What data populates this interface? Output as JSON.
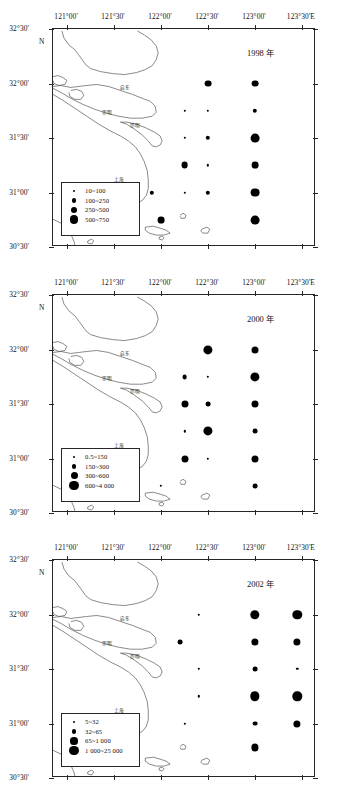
{
  "figure": {
    "caption": "",
    "axis": {
      "x_ticks": [
        "121°00'",
        "121°30'",
        "122°00'",
        "122°30'",
        "123°00'",
        "123°30'E"
      ],
      "x_values": [
        121.0,
        121.5,
        122.0,
        122.5,
        123.0,
        123.5
      ],
      "y_ticks": [
        "32°30'",
        "32°00'",
        "31°30'",
        "31°00'",
        "30°30'"
      ],
      "y_values": [
        32.5,
        32.0,
        31.5,
        31.0,
        30.5
      ],
      "north_label": "N",
      "xlim": [
        120.85,
        123.65
      ],
      "ylim": [
        30.5,
        32.5
      ]
    },
    "places": [
      {
        "name": "启东",
        "x": 121.62,
        "y": 31.97
      },
      {
        "name": "崇明",
        "x": 121.43,
        "y": 31.74
      },
      {
        "name": "崇明",
        "x": 121.72,
        "y": 31.62
      },
      {
        "name": "上海",
        "x": 121.55,
        "y": 31.12
      }
    ]
  },
  "chart_data": [
    {
      "type": "scatter",
      "title": "1998 年",
      "xlabel": "",
      "ylabel": "",
      "xlim": [
        120.85,
        123.65
      ],
      "ylim": [
        30.5,
        32.5
      ],
      "grid": false,
      "legend_position": "bottom-left",
      "legend_title": "",
      "size_classes": [
        {
          "label": "10~100",
          "radius_px": 1.2,
          "range": [
            10,
            100
          ]
        },
        {
          "label": "100~250",
          "radius_px": 2.2,
          "range": [
            100,
            250
          ]
        },
        {
          "label": "250~500",
          "radius_px": 3.4,
          "range": [
            250,
            500
          ]
        },
        {
          "label": "500~750",
          "radius_px": 4.4,
          "range": [
            500,
            750
          ]
        }
      ],
      "points": [
        {
          "x": 122.5,
          "y": 32.0,
          "class": 2
        },
        {
          "x": 123.0,
          "y": 32.0,
          "class": 2
        },
        {
          "x": 122.25,
          "y": 31.75,
          "class": 0
        },
        {
          "x": 122.5,
          "y": 31.75,
          "class": 0
        },
        {
          "x": 123.0,
          "y": 31.75,
          "class": 1
        },
        {
          "x": 122.25,
          "y": 31.5,
          "class": 0
        },
        {
          "x": 122.5,
          "y": 31.5,
          "class": 1
        },
        {
          "x": 123.0,
          "y": 31.5,
          "class": 3
        },
        {
          "x": 122.25,
          "y": 31.25,
          "class": 2
        },
        {
          "x": 122.5,
          "y": 31.25,
          "class": 0
        },
        {
          "x": 123.0,
          "y": 31.25,
          "class": 2
        },
        {
          "x": 121.9,
          "y": 31.0,
          "class": 1
        },
        {
          "x": 122.25,
          "y": 31.0,
          "class": 0
        },
        {
          "x": 122.5,
          "y": 31.0,
          "class": 1
        },
        {
          "x": 123.0,
          "y": 31.0,
          "class": 3
        },
        {
          "x": 122.0,
          "y": 30.75,
          "class": 2
        },
        {
          "x": 123.0,
          "y": 30.75,
          "class": 3
        }
      ]
    },
    {
      "type": "scatter",
      "title": "2000 年",
      "xlabel": "",
      "ylabel": "",
      "xlim": [
        120.85,
        123.65
      ],
      "ylim": [
        30.5,
        32.5
      ],
      "grid": false,
      "legend_position": "bottom-left",
      "legend_title": "",
      "size_classes": [
        {
          "label": "0.5~150",
          "radius_px": 1.2,
          "range": [
            0.5,
            150
          ]
        },
        {
          "label": "150~300",
          "radius_px": 2.4,
          "range": [
            150,
            300
          ]
        },
        {
          "label": "300~600",
          "radius_px": 3.5,
          "range": [
            300,
            600
          ]
        },
        {
          "label": "600~4 000",
          "radius_px": 4.6,
          "range": [
            600,
            4000
          ]
        }
      ],
      "points": [
        {
          "x": 122.5,
          "y": 32.0,
          "class": 3
        },
        {
          "x": 123.0,
          "y": 32.0,
          "class": 2
        },
        {
          "x": 122.25,
          "y": 31.75,
          "class": 1
        },
        {
          "x": 122.5,
          "y": 31.75,
          "class": 0
        },
        {
          "x": 123.0,
          "y": 31.75,
          "class": 3
        },
        {
          "x": 122.25,
          "y": 31.5,
          "class": 2
        },
        {
          "x": 122.5,
          "y": 31.5,
          "class": 1
        },
        {
          "x": 123.0,
          "y": 31.5,
          "class": 2
        },
        {
          "x": 122.25,
          "y": 31.25,
          "class": 0
        },
        {
          "x": 122.5,
          "y": 31.25,
          "class": 3
        },
        {
          "x": 123.0,
          "y": 31.25,
          "class": 1
        },
        {
          "x": 122.25,
          "y": 31.0,
          "class": 2
        },
        {
          "x": 122.5,
          "y": 31.0,
          "class": 0
        },
        {
          "x": 123.0,
          "y": 31.0,
          "class": 2
        },
        {
          "x": 122.0,
          "y": 30.75,
          "class": 0
        },
        {
          "x": 123.0,
          "y": 30.75,
          "class": 1
        }
      ]
    },
    {
      "type": "scatter",
      "title": "2002 年",
      "xlabel": "",
      "ylabel": "",
      "xlim": [
        120.85,
        123.65
      ],
      "ylim": [
        30.5,
        32.5
      ],
      "grid": false,
      "legend_position": "bottom-left",
      "legend_title": "",
      "size_classes": [
        {
          "label": "5~32",
          "radius_px": 1.2,
          "range": [
            5,
            32
          ]
        },
        {
          "label": "32~65",
          "radius_px": 2.4,
          "range": [
            32,
            65
          ]
        },
        {
          "label": "65~1 000",
          "radius_px": 3.6,
          "range": [
            65,
            1000
          ]
        },
        {
          "label": "1 000~25 000",
          "radius_px": 4.7,
          "range": [
            1000,
            25000
          ]
        }
      ],
      "points": [
        {
          "x": 122.4,
          "y": 32.0,
          "class": 0
        },
        {
          "x": 123.0,
          "y": 32.0,
          "class": 3
        },
        {
          "x": 123.45,
          "y": 32.0,
          "class": 3
        },
        {
          "x": 122.2,
          "y": 31.75,
          "class": 1
        },
        {
          "x": 123.0,
          "y": 31.75,
          "class": 2
        },
        {
          "x": 123.45,
          "y": 31.75,
          "class": 2
        },
        {
          "x": 122.4,
          "y": 31.5,
          "class": 0
        },
        {
          "x": 123.0,
          "y": 31.5,
          "class": 1
        },
        {
          "x": 123.45,
          "y": 31.5,
          "class": 0
        },
        {
          "x": 122.4,
          "y": 31.25,
          "class": 0
        },
        {
          "x": 123.0,
          "y": 31.25,
          "class": 3
        },
        {
          "x": 123.45,
          "y": 31.25,
          "class": 3
        },
        {
          "x": 122.25,
          "y": 31.0,
          "class": 0
        },
        {
          "x": 123.0,
          "y": 31.0,
          "class": 1
        },
        {
          "x": 123.45,
          "y": 31.0,
          "class": 2
        },
        {
          "x": 123.0,
          "y": 30.78,
          "class": 2
        }
      ]
    }
  ]
}
